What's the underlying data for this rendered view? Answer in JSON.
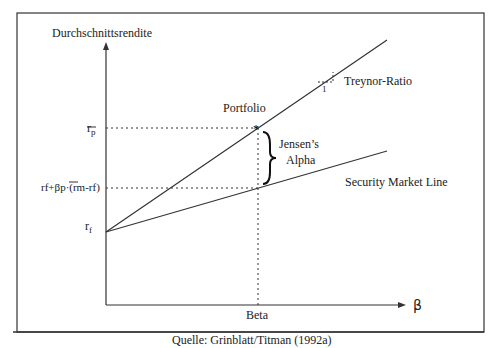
{
  "diagram": {
    "y_axis_label": "Durchschnittsrendite",
    "x_axis_label": "β",
    "x_tick_label": "Beta",
    "portfolio_label": "Portfolio",
    "jensen_label_line1": "Jensen’s",
    "jensen_label_line2": "Alpha",
    "treynor_label": "Treynor-Ratio",
    "treynor_unit": "1",
    "sml_label": "Security Market Line",
    "rp_label": "r",
    "rp_sub": "p",
    "rf_label": "r",
    "rf_sub": "f",
    "expected_label": "rf+βp·(rm-rf)",
    "source": "Quelle: Grinblatt/Titman (1992a)"
  }
}
